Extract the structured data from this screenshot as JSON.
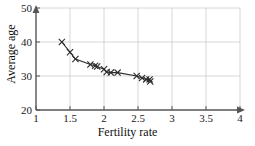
{
  "chart_data": {
    "type": "scatter",
    "title": "",
    "subtitle": "",
    "xlabel": "Fertility rate",
    "ylabel": "Average age",
    "xlim": [
      1,
      4
    ],
    "ylim": [
      20,
      50
    ],
    "xticks": [
      "1",
      "1.5",
      "2",
      "2.5",
      "3",
      "3.5",
      "4"
    ],
    "xtick_values": [
      1,
      1.5,
      2,
      2.5,
      3,
      3.5,
      4
    ],
    "yticks": [
      "20",
      "30",
      "40",
      "50"
    ],
    "ytick_values": [
      20,
      30,
      40,
      50
    ],
    "grid": true,
    "grid_color": "#cccccc",
    "legend": "none",
    "marker": "x-cross",
    "marker_color": "#2b2b2b",
    "trend_line": true,
    "trend_line_color": "#2b2b2b",
    "series": [
      {
        "name": "countries",
        "x": [
          1.38,
          1.5,
          1.58,
          1.8,
          1.87,
          1.9,
          2.0,
          2.04,
          2.1,
          2.2,
          2.48,
          2.56,
          2.62,
          2.67,
          2.68
        ],
        "y": [
          40.0,
          37.0,
          35.0,
          33.4,
          33.0,
          32.8,
          32.0,
          31.2,
          31.0,
          31.0,
          30.0,
          29.4,
          29.0,
          29.0,
          28.4
        ]
      }
    ]
  },
  "axes": {
    "x_title": "Fertility rate",
    "y_title": "Average age"
  }
}
